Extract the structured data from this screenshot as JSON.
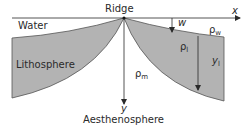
{
  "diagram": {
    "labels": {
      "water": "Water",
      "ridge": "Ridge",
      "lithosphere": "Lithosphere",
      "aesthenosphere": "Aesthenosphere",
      "x_axis": "x",
      "y_axis": "y",
      "w": "w",
      "rho": "ρ",
      "rho_w_sub": "w",
      "rho_l_sub": "l",
      "rho_m_sub": "m",
      "y_l_main": "y",
      "y_l_sub": "l"
    },
    "colors": {
      "lithosphere_fill": "#b3b3b3",
      "line": "#2a2a2a",
      "background": "#ffffff"
    }
  }
}
